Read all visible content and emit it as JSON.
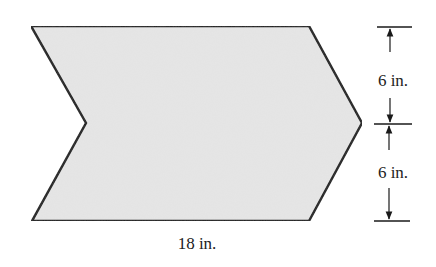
{
  "figure": {
    "shape": "chevron-arrow",
    "fill_color": "#e6e6e6",
    "stroke_color": "#1a1a1a",
    "bottom_label": "18 in.",
    "dimensions": [
      {
        "label": "6 in.",
        "segment": "upper"
      },
      {
        "label": "6 in.",
        "segment": "lower"
      }
    ]
  }
}
